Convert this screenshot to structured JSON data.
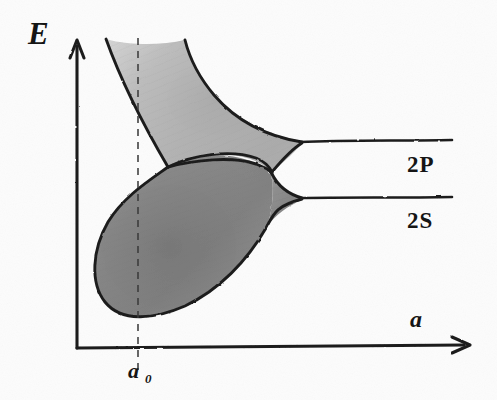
{
  "figure": {
    "kind": "hand-drawn-pencil-sketch",
    "background_color": "#fcfcfc",
    "ink_color": "#1d1d1d"
  },
  "axes": {
    "y_label": "E",
    "x_label": "a",
    "tick_label_main": "a",
    "tick_label_sub": "0",
    "origin_x": 77,
    "origin_y": 348,
    "y_top": 38,
    "x_right": 470
  },
  "levels": [
    {
      "id": "upper",
      "label": "2P",
      "y": 143,
      "x_start": 300,
      "x_end": 452
    },
    {
      "id": "lower",
      "label": "2S",
      "y": 199,
      "x_start": 300,
      "x_end": 452
    }
  ],
  "marker": {
    "name": "equilibrium-spacing",
    "x": 138,
    "y_top": 38,
    "y_bottom": 372,
    "label": "a0"
  },
  "bands": [
    {
      "id": "upper-band",
      "level": "2P",
      "fill": "#c2c2c2",
      "description": "Upper shaded band widening toward small interatomic distance"
    },
    {
      "id": "lower-band",
      "level": "2S",
      "fill": "#8d8d8d",
      "description": "Lower shaded lobe widening toward small interatomic distance"
    }
  ],
  "shading": {
    "upper_light": "#c8c8c8",
    "upper_mid": "#b4b4b4",
    "lower_mid": "#929292",
    "lower_dark": "#7b7b7b"
  },
  "annotations": {
    "cusp_x": 272,
    "cusp_y": 172,
    "notch_x": 168,
    "notch_y": 167
  }
}
